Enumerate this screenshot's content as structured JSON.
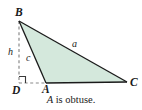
{
  "figure": {
    "caption_variable": "A",
    "caption_rest": " is obtuse.",
    "caption_full": "A is obtuse.",
    "colors": {
      "background": "#ffffff",
      "triangle_fill": "#d4e8dc",
      "stroke": "#1a1a1a",
      "dashed_stroke": "#8a8a8a",
      "label_text": "#1a1a1a"
    },
    "vertices": {
      "B": {
        "label": "B",
        "x": 19,
        "y": 21
      },
      "A": {
        "label": "A",
        "x": 46,
        "y": 83
      },
      "C": {
        "label": "C",
        "x": 127,
        "y": 82
      },
      "D": {
        "label": "D",
        "x": 19,
        "y": 83
      }
    },
    "side_labels": {
      "a": {
        "label": "a",
        "description": "side-from-B-to-C"
      },
      "c": {
        "label": "c",
        "description": "side-from-B-to-A"
      },
      "h": {
        "label": "h",
        "description": "altitude-from-B-to-D"
      }
    },
    "segments": {
      "altitude_dashed": "B to D",
      "base_extension_dashed": "D to A",
      "base_solid": "A to C",
      "side_a_solid": "B to C",
      "side_c_solid": "B to A"
    },
    "right_angle_marker": {
      "at_vertex": "D",
      "size": 7
    }
  }
}
